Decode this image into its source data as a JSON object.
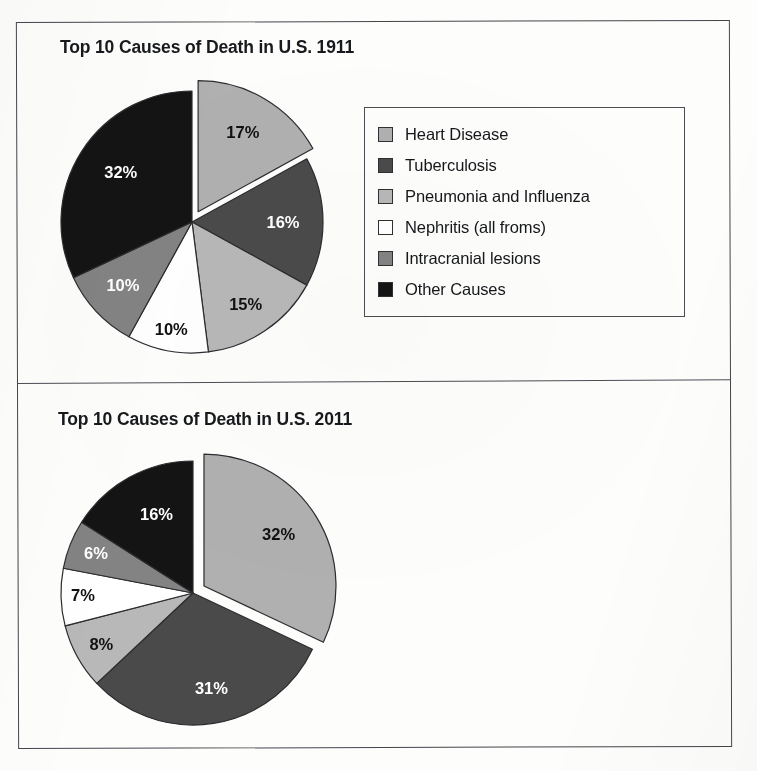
{
  "figure": {
    "panels": [
      {
        "id": "1911",
        "title": "Top 10 Causes of Death in U.S. 1911"
      },
      {
        "id": "2011",
        "title": "Top 10 Causes of Death in U.S. 2011"
      }
    ]
  },
  "legend_1911": {
    "items": [
      {
        "label": "Heart Disease",
        "color": "#b0b0b0"
      },
      {
        "label": "Tuberculosis",
        "color": "#4a4a4a"
      },
      {
        "label": "Pneumonia and Influenza",
        "color": "#b8b8b8"
      },
      {
        "label": "Nephritis (all froms)",
        "color": "#ffffff"
      },
      {
        "label": "Intracranial lesions",
        "color": "#838383"
      },
      {
        "label": "Other Causes",
        "color": "#141414"
      }
    ]
  },
  "legend_2011": {
    "items": [
      {
        "label": "Heart Disease",
        "color": "#b0b0b0"
      },
      {
        "label": "Malignant Neoplams",
        "color": "#4a4a4a"
      },
      {
        "label": "Lower Respiratory Infection",
        "color": "#b8b8b8"
      },
      {
        "label": "Cerebrovascular Disease",
        "color": "#ffffff"
      },
      {
        "label": "Accidents",
        "color": "#838383"
      },
      {
        "label": "Other Causes",
        "color": "#141414"
      }
    ]
  },
  "chart_data": [
    {
      "type": "pie",
      "title": "Top 10 Causes of Death in U.S. 1911",
      "xlabel": "",
      "ylabel": "",
      "legend_position": "right",
      "grid": false,
      "start_angle_deg": 0,
      "direction": "clockwise",
      "exploded_slices": [
        0
      ],
      "units": "percent",
      "categories": [
        "Heart Disease",
        "Tuberculosis",
        "Pneumonia and Influenza",
        "Nephritis (all froms)",
        "Intracranial lesions",
        "Other Causes"
      ],
      "values": [
        17,
        16,
        15,
        10,
        10,
        32
      ],
      "data_labels": [
        "17%",
        "16%",
        "15%",
        "10%",
        "10%",
        "32%"
      ],
      "colors": [
        "#b0b0b0",
        "#4a4a4a",
        "#b8b8b8",
        "#ffffff",
        "#838383",
        "#141414"
      ]
    },
    {
      "type": "pie",
      "title": "Top 10 Causes of Death in U.S. 2011",
      "xlabel": "",
      "ylabel": "",
      "legend_position": "right",
      "grid": false,
      "start_angle_deg": 0,
      "direction": "clockwise",
      "exploded_slices": [
        0
      ],
      "units": "percent",
      "categories": [
        "Heart Disease",
        "Malignant Neoplams",
        "Lower Respiratory Infection",
        "Cerebrovascular Disease",
        "Accidents",
        "Other Causes"
      ],
      "values": [
        32,
        31,
        8,
        7,
        6,
        16
      ],
      "data_labels": [
        "32%",
        "31%",
        "8%",
        "7%",
        "6%",
        "16%"
      ],
      "colors": [
        "#b0b0b0",
        "#4a4a4a",
        "#b8b8b8",
        "#ffffff",
        "#838383",
        "#141414"
      ]
    }
  ]
}
